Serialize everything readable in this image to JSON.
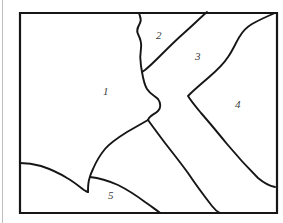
{
  "figure": {
    "type": "line-drawing-map",
    "background_color": "#ffffff",
    "stroke_color": "#161616",
    "frame": {
      "x": 20,
      "y": 13,
      "width": 257,
      "height": 200,
      "stroke_width": 2.2
    },
    "boundary_stroke_width": 1.9
  },
  "regions": [
    {
      "id": "region-1",
      "label": "1",
      "label_x": 103,
      "label_y": 86
    },
    {
      "id": "region-2",
      "label": "2",
      "label_x": 156,
      "label_y": 30
    },
    {
      "id": "region-3",
      "label": "3",
      "label_x": 195,
      "label_y": 51
    },
    {
      "id": "region-4",
      "label": "4",
      "label_x": 235,
      "label_y": 99
    },
    {
      "id": "region-5",
      "label": "5",
      "label_x": 108,
      "label_y": 190
    }
  ],
  "boundaries": [
    {
      "id": "boundary-1-2-3",
      "name": "wiggly-north-south-boundary",
      "path": "M 139 13 C 140 17 142 19 140 23 C 138 27 136 30 138 34 C 140 38 142 42 141 48 C 140 54 140 60 141 66 L 142 72 C 143 78 144 84 147 89 C 150 94 155 96 158 99 C 161 103 161 108 158 111 C 155 114 151 115 149 118 L 148 120"
    },
    {
      "id": "boundary-2-3",
      "name": "diagonal-boundary-two-three",
      "path": "M 207 12 C 200 18 192 26 184 33 C 176 40 168 48 160 56 C 155 61 150 66 145 70 L 142 72"
    },
    {
      "id": "boundary-3-4",
      "name": "chevron-boundary-three-four",
      "path": "M 275 13 C 268 16 259 20 252 24 C 247 27 243 31 240 36 C 236 42 233 50 228 57 C 223 65 215 72 208 78 C 201 84 194 90 190 94 L 188 96 C 191 101 196 107 201 113 C 209 122 218 133 227 144 C 237 156 248 168 258 178 C 264 183 270 186 275 187"
    },
    {
      "id": "boundary-3-5",
      "name": "diagonal-boundary-three-five",
      "path": "M 148 120 C 153 127 159 135 165 143 C 172 152 180 162 188 173 C 196 185 205 197 212 206 C 215 210 218 212 220 213"
    },
    {
      "id": "boundary-1-5-west",
      "name": "curved-boundary-one-five",
      "path": "M 148 120 C 141 124 134 128 127 132 C 119 137 111 142 105 149 C 100 155 96 162 93 169 C 91 173 90 176 89 180 C 88 184 88 188 88 192"
    },
    {
      "id": "boundary-1-5-left-edge",
      "name": "left-entry-boundary",
      "path": "M 20 163 C 27 163 34 164 41 166 C 50 169 59 173 67 178 C 74 182 80 187 84 190 C 86 191 87 192 88 192"
    },
    {
      "id": "boundary-5-south",
      "name": "southern-arc-boundary",
      "path": "M 90 177 C 99 178 109 181 118 185 C 128 190 137 196 145 202 C 151 206 156 210 159 212 L 160 213"
    }
  ]
}
